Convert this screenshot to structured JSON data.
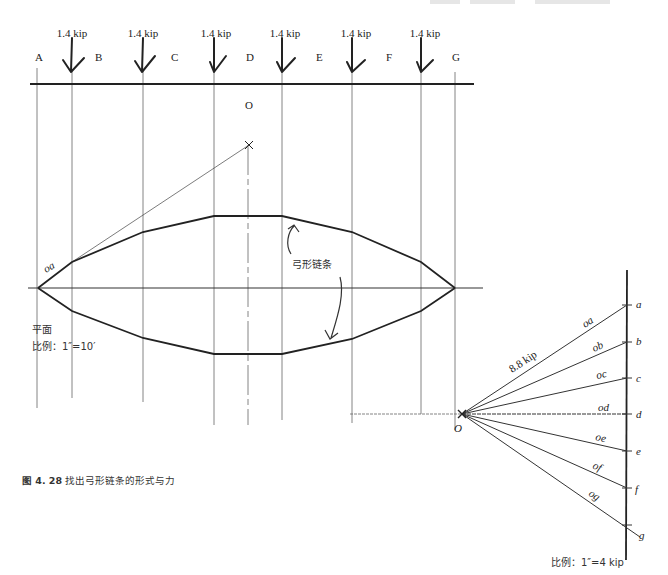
{
  "figure": {
    "caption_number": "图 4. 28",
    "caption_text": "找出弓形链条的形式与力"
  },
  "plan": {
    "title": "平面",
    "scale": "比例：1″=10′",
    "loads": [
      {
        "label": "1.4 kip",
        "x": 72
      },
      {
        "label": "1.4 kip",
        "x": 143
      },
      {
        "label": "1.4 kip",
        "x": 214
      },
      {
        "label": "1.4 kip",
        "x": 282
      },
      {
        "label": "1.4 kip",
        "x": 352
      },
      {
        "label": "1.4 kip",
        "x": 421
      }
    ],
    "space_labels": [
      "A",
      "B",
      "C",
      "D",
      "E",
      "F",
      "G"
    ],
    "pole_label": "O",
    "segment_label": "oa",
    "chain_annotation": "弓形链条"
  },
  "force_polygon": {
    "pole_label": "O",
    "resultant_label": "8.8 kip",
    "points": [
      "a",
      "b",
      "c",
      "d",
      "e",
      "f",
      "g"
    ],
    "rays": [
      "oa",
      "ob",
      "oc",
      "od",
      "oe",
      "of",
      "og"
    ],
    "scale": "比例：1″=4 kip"
  }
}
